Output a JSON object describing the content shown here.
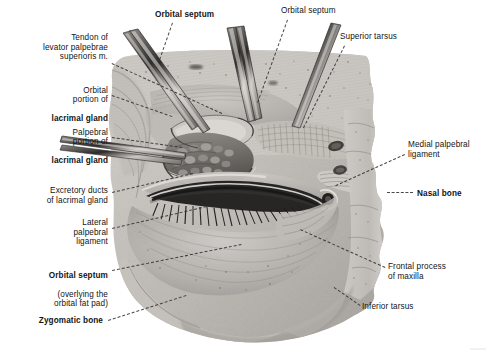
{
  "figure": {
    "background_color": "#ffffff",
    "ink_color": "#141414",
    "leader_color": "#2b2b2b",
    "width": 491,
    "height": 361
  },
  "labels": [
    {
      "id": "orbital-septum-top-left",
      "text": "Orbital septum",
      "bold": true,
      "align": "left",
      "x": 155,
      "y": 10,
      "width": 80
    },
    {
      "id": "orbital-septum-top-right",
      "text": "Orbital septum",
      "bold": false,
      "align": "left",
      "x": 281,
      "y": 6,
      "width": 80
    },
    {
      "id": "superior-tarsus",
      "text": "Superior tarsus",
      "bold": false,
      "align": "left",
      "x": 340,
      "y": 32,
      "width": 80
    },
    {
      "id": "tendon-of-levator",
      "text": "Tendon of\nlevator palpebrae\nsuperioris m.",
      "bold": false,
      "align": "right",
      "x": 5,
      "y": 33,
      "width": 103
    },
    {
      "id": "orbital-portion-lacrimal-gland",
      "text_thin": "Orbital\nportion of",
      "text_bold": "lacrimal gland",
      "align": "right",
      "x": 5,
      "y": 76,
      "width": 103
    },
    {
      "id": "palpebral-portion-lacrimal-gland",
      "text_thin": "Palpebral\nportion of",
      "text_bold": "lacrimal gland",
      "align": "right",
      "x": 2,
      "y": 118,
      "width": 106
    },
    {
      "id": "excretory-ducts",
      "text": "Excretory ducts\nof lacrimal gland",
      "bold": false,
      "align": "right",
      "x": 2,
      "y": 186,
      "width": 106
    },
    {
      "id": "lateral-palpebral-ligament",
      "text": "Lateral\npalpebral\nligament",
      "bold": false,
      "align": "right",
      "x": 5,
      "y": 218,
      "width": 103
    },
    {
      "id": "orbital-septum-fat-pad",
      "text_bold": "Orbital septum",
      "text_thin": "(overlying the\norbital fat pad)",
      "align": "right",
      "x": 2,
      "y": 261,
      "width": 106
    },
    {
      "id": "zygomatic-bone",
      "text": "Zygomatic bone",
      "bold": true,
      "align": "right",
      "x": 5,
      "y": 316,
      "width": 98
    },
    {
      "id": "medial-palpebral-ligament",
      "text": "Medial palpebral\nligament",
      "bold": false,
      "align": "left",
      "x": 408,
      "y": 140,
      "width": 82
    },
    {
      "id": "nasal-bone",
      "text": "Nasal bone",
      "bold": true,
      "align": "left",
      "x": 417,
      "y": 189,
      "width": 70
    },
    {
      "id": "frontal-process-of-maxilla",
      "text": "Frontal process\nof maxilla",
      "bold": false,
      "align": "left",
      "x": 388,
      "y": 262,
      "width": 82
    },
    {
      "id": "inferior-tarsus",
      "text": "Inferior tarsus",
      "bold": false,
      "align": "left",
      "x": 362,
      "y": 302,
      "width": 76
    }
  ],
  "leaders": [
    {
      "id": "leader-orbital-septum-top-left",
      "x1": 173,
      "y1": 23,
      "x2": 160,
      "y2": 60
    },
    {
      "id": "leader-orbital-septum-top-right",
      "x1": 288,
      "y1": 20,
      "x2": 258,
      "y2": 103
    },
    {
      "id": "leader-superior-tarsus",
      "x1": 345,
      "y1": 46,
      "x2": 304,
      "y2": 128
    },
    {
      "id": "leader-tendon-of-levator",
      "x1": 112,
      "y1": 63,
      "x2": 222,
      "y2": 113
    },
    {
      "id": "leader-orbital-portion",
      "x1": 112,
      "y1": 95,
      "x2": 172,
      "y2": 116
    },
    {
      "id": "leader-palpebral-portion",
      "x1": 112,
      "y1": 137,
      "x2": 182,
      "y2": 147
    },
    {
      "id": "leader-excretory-ducts",
      "x1": 112,
      "y1": 192,
      "x2": 193,
      "y2": 173
    },
    {
      "id": "leader-lateral-palpebral",
      "x1": 112,
      "y1": 228,
      "x2": 211,
      "y2": 205
    },
    {
      "id": "leader-orbital-septum-fat",
      "x1": 112,
      "y1": 270,
      "x2": 241,
      "y2": 244
    },
    {
      "id": "leader-zygomatic-bone",
      "x1": 108,
      "y1": 320,
      "x2": 186,
      "y2": 295
    },
    {
      "id": "leader-medial-palpebral",
      "x1": 405,
      "y1": 155,
      "x2": 336,
      "y2": 186
    },
    {
      "id": "leader-nasal-bone",
      "x1": 413,
      "y1": 193,
      "x2": 387,
      "y2": 193
    },
    {
      "id": "leader-frontal-process",
      "x1": 385,
      "y1": 268,
      "x2": 300,
      "y2": 230
    },
    {
      "id": "leader-inferior-tarsus",
      "x1": 360,
      "y1": 306,
      "x2": 334,
      "y2": 288
    }
  ],
  "artwork": {
    "subject": "anatomical dissection of the right orbit, anterior view",
    "style": "halftone pencil/stipple medical illustration, grayscale",
    "parts": [
      "skin and soft tissue field",
      "orbital septum sheet",
      "orbital portion of lacrimal gland",
      "palpebral portion of lacrimal gland",
      "excretory ducts of lacrimal gland",
      "superior tarsus",
      "inferior tarsus",
      "medial palpebral ligament",
      "lateral palpebral ligament",
      "palpebral fissure with eyelashes",
      "nasal bone",
      "frontal process of maxilla",
      "zygomatic bone",
      "two dissecting probes at upper lid",
      "one dissecting probe at lateral canthus"
    ],
    "tones": {
      "lightest": "#e9e7e4",
      "mid": "#b9b5b0",
      "shadow": "#8a8682",
      "dark": "#4e4b48",
      "darkest": "#1a1918"
    }
  }
}
